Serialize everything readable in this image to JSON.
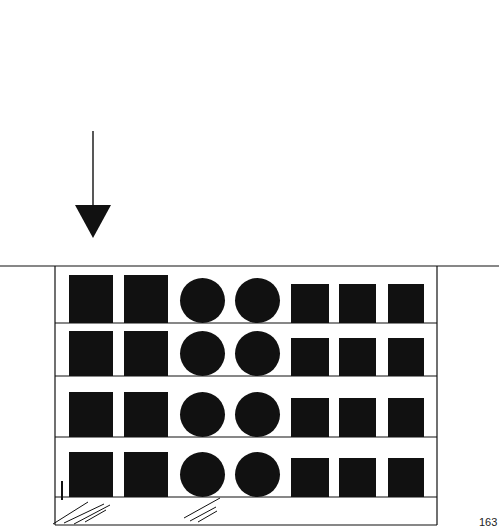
{
  "page_number": "163",
  "colors": {
    "ink": "#111111",
    "paper": "#ffffff"
  },
  "arrow": {
    "x": 93,
    "line_top": 131,
    "line_bottom": 206,
    "head_top": 205,
    "head_bottom": 238,
    "head_half_width": 18,
    "direction": "down"
  },
  "ground_line": {
    "y": 266,
    "x1": 0,
    "x2": 499
  },
  "frame": {
    "left": 55,
    "right": 437,
    "top": 266,
    "bottom": 525
  },
  "shelves": [
    {
      "line_y": 323,
      "big_top": 275,
      "circle_top": 277,
      "small_top": 284
    },
    {
      "line_y": 376,
      "big_top": 331,
      "circle_top": 330,
      "small_top": 338
    },
    {
      "line_y": 437,
      "big_top": 392,
      "circle_top": 391,
      "small_top": 398
    },
    {
      "line_y": 497,
      "big_top": 452,
      "circle_top": 450,
      "small_top": 458
    }
  ],
  "items_per_shelf": [
    {
      "shape": "square",
      "size": "large",
      "x": 69,
      "w": 44
    },
    {
      "shape": "square",
      "size": "large",
      "x": 124,
      "w": 44
    },
    {
      "shape": "circle",
      "x": 180,
      "w": 45
    },
    {
      "shape": "circle",
      "x": 235,
      "w": 45
    },
    {
      "shape": "square",
      "size": "small",
      "x": 291,
      "w": 38
    },
    {
      "shape": "square",
      "size": "small",
      "x": 339,
      "w": 37
    },
    {
      "shape": "square",
      "size": "small",
      "x": 388,
      "w": 36
    }
  ],
  "tick_mark": {
    "x": 62,
    "y1": 481,
    "y2": 500
  },
  "hatch_groups": [
    {
      "name": "floor-hatch-left",
      "lines": [
        [
          53,
          524,
          88,
          502
        ],
        [
          64,
          523,
          104,
          504
        ],
        [
          74,
          524,
          110,
          505
        ],
        [
          85,
          522,
          106,
          510
        ]
      ]
    },
    {
      "name": "floor-hatch-right",
      "lines": [
        [
          184,
          518,
          220,
          498
        ],
        [
          190,
          521,
          216,
          507
        ],
        [
          198,
          522,
          217,
          511
        ]
      ]
    }
  ]
}
